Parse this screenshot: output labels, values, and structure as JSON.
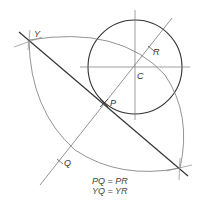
{
  "diagram": {
    "labels": {
      "Y": "Y",
      "R": "R",
      "C": "C",
      "P": "P",
      "Q": "Q"
    },
    "equations": [
      "PQ = PR",
      "YQ = YR"
    ],
    "colors": {
      "stroke": "#333333",
      "thin": "#777777",
      "background": "#ffffff"
    }
  }
}
